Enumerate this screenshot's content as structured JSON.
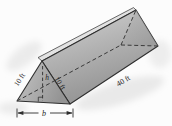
{
  "figure": {
    "name": "triangular-prism-diagram",
    "labels": {
      "left_slant_edge": "10 ft",
      "right_slant_edge": "10 ft",
      "prism_length": "40 ft",
      "triangle_height": "h",
      "triangle_base": "b"
    },
    "colors": {
      "background": "#fcfcfc",
      "shadow": "#e9e9e9",
      "edge_stroke": "#2e2e2e",
      "dashed_stroke": "#3a3a3a",
      "face_front_light": "#c6c6c6",
      "face_front_dark": "#949494",
      "face_top_light": "#d2d2d2",
      "face_top_dark": "#919191",
      "ridge_sliver": "#e2e2e2",
      "far_end_shade": "#8f8f8f",
      "text": "#1c1c1c"
    }
  }
}
